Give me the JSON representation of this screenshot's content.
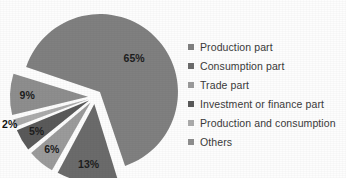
{
  "chart_data": {
    "type": "pie",
    "title": "",
    "categories": [
      "Production part",
      "Consumption part",
      "Trade part",
      "Investment or finance part",
      "Production and consumption",
      "Others"
    ],
    "values": [
      65,
      13,
      6,
      5,
      2,
      9
    ],
    "value_labels": [
      "65%",
      "13%",
      "6%",
      "5%",
      "2%",
      "9%"
    ],
    "unit": "%",
    "exploded": true,
    "legend_position": "right",
    "grid": false,
    "colors": [
      "#808080",
      "#6b6b6b",
      "#9b9b9b",
      "#5a5a5a",
      "#ababab",
      "#8e8e8e"
    ],
    "background_color": "#fdfdfd",
    "label_color": "#1d1d1d"
  },
  "pie": {
    "slices": [
      {
        "label": "65%",
        "value": 65,
        "color": "#808080",
        "name": "Production part"
      },
      {
        "label": "13%",
        "value": 13,
        "color": "#6b6b6b",
        "name": "Consumption part"
      },
      {
        "label": "6%",
        "value": 6,
        "color": "#9b9b9b",
        "name": "Trade part"
      },
      {
        "label": "5%",
        "value": 5,
        "color": "#5a5a5a",
        "name": "Investment or finance part"
      },
      {
        "label": "2%",
        "value": 2,
        "color": "#ababab",
        "name": "Production and consumption"
      },
      {
        "label": "9%",
        "value": 9,
        "color": "#8e8e8e",
        "name": "Others"
      }
    ]
  },
  "legend": {
    "items": [
      {
        "label": "Production part",
        "color": "#808080"
      },
      {
        "label": "Consumption part",
        "color": "#6b6b6b"
      },
      {
        "label": "Trade part",
        "color": "#9b9b9b"
      },
      {
        "label": "Investment or finance part",
        "color": "#5a5a5a"
      },
      {
        "label": "Production and consumption",
        "color": "#ababab"
      },
      {
        "label": "Others",
        "color": "#8e8e8e"
      }
    ]
  }
}
